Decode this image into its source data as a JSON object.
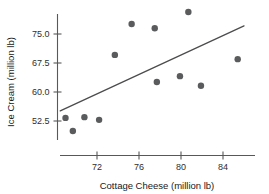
{
  "chart_data": {
    "type": "scatter",
    "title": "",
    "xlabel": "Cottage Cheese (million lb)",
    "ylabel": "Ice Cream (million lb)",
    "xticks": [
      72,
      76,
      80,
      84
    ],
    "xtick_labels": [
      "72",
      "76",
      "80",
      "84"
    ],
    "yticks": [
      52.5,
      60.0,
      67.5,
      75.0
    ],
    "ytick_labels": [
      "52.5",
      "60.0",
      "67.5",
      "75.0"
    ],
    "xlim": [
      68.4,
      86.7
    ],
    "ylim": [
      47.1,
      82.6
    ],
    "grid": false,
    "legend": null,
    "point_color": "#595b5d",
    "line_color": "#4c4c4e",
    "axis_color": "#58585a",
    "points": [
      {
        "x": 69.0,
        "y": 53.3
      },
      {
        "x": 69.7,
        "y": 49.9
      },
      {
        "x": 70.8,
        "y": 53.5
      },
      {
        "x": 72.2,
        "y": 52.8
      },
      {
        "x": 73.7,
        "y": 69.6
      },
      {
        "x": 75.3,
        "y": 77.6
      },
      {
        "x": 77.5,
        "y": 76.5
      },
      {
        "x": 77.7,
        "y": 62.6
      },
      {
        "x": 79.9,
        "y": 64.1
      },
      {
        "x": 80.7,
        "y": 80.7
      },
      {
        "x": 81.9,
        "y": 61.6
      },
      {
        "x": 85.4,
        "y": 68.5
      }
    ],
    "trend_line": {
      "x_start": 68.5,
      "y_start": 55.1,
      "x_end": 86.0,
      "y_end": 77.1
    }
  }
}
